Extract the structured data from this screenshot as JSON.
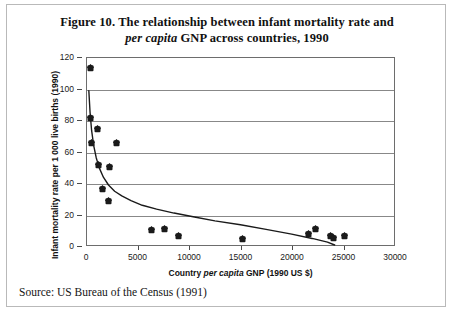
{
  "figure": {
    "title_line1": "Figure 10. The relationship between infant mortality rate and",
    "title_line2_italic": "per capita",
    "title_line2_rest": " GNP across countries, 1990",
    "source": "Source: US Bureau of the Census (1991)"
  },
  "chart_data": {
    "type": "scatter",
    "title": "Figure 10. The relationship between infant mortality rate and per capita GNP across countries, 1990",
    "xlabel_prefix": "Country ",
    "xlabel_italic": "per capita",
    "xlabel_suffix": " GNP (1990 US $)",
    "xlabel": "Country per capita GNP (1990 US $)",
    "ylabel": "Infant mortality rate per 1 000 live births (1990)",
    "xlim": [
      0,
      30000
    ],
    "ylim": [
      0,
      120
    ],
    "xticks": [
      0,
      5000,
      10000,
      15000,
      20000,
      25000,
      30000
    ],
    "yticks": [
      0,
      20,
      40,
      60,
      80,
      100,
      120
    ],
    "xtick_labels": [
      "0",
      "5000",
      "10000",
      "15000",
      "20000",
      "25000",
      "30000"
    ],
    "ytick_labels": [
      "0",
      "20",
      "40",
      "60",
      "80",
      "100",
      "120"
    ],
    "grid": "horizontal",
    "legend": "none",
    "marker": "diamond",
    "marker_color": "#1a1a1a",
    "curve_color": "#1a1a1a",
    "points": [
      {
        "x": 300,
        "y": 114.0
      },
      {
        "x": 350,
        "y": 82.5
      },
      {
        "x": 420,
        "y": 66.5
      },
      {
        "x": 1000,
        "y": 75.0
      },
      {
        "x": 1100,
        "y": 52.5
      },
      {
        "x": 1500,
        "y": 37.0
      },
      {
        "x": 2100,
        "y": 29.5
      },
      {
        "x": 2200,
        "y": 51.0
      },
      {
        "x": 2900,
        "y": 66.5
      },
      {
        "x": 6300,
        "y": 11.0
      },
      {
        "x": 7500,
        "y": 11.5
      },
      {
        "x": 8900,
        "y": 7.0
      },
      {
        "x": 15100,
        "y": 5.5
      },
      {
        "x": 21500,
        "y": 8.5
      },
      {
        "x": 22200,
        "y": 11.5
      },
      {
        "x": 23600,
        "y": 7.5
      },
      {
        "x": 23900,
        "y": 6.0
      },
      {
        "x": 25000,
        "y": 7.5
      }
    ],
    "fit_curve": [
      {
        "x": 180,
        "y": 99.0
      },
      {
        "x": 300,
        "y": 85.0
      },
      {
        "x": 450,
        "y": 73.5
      },
      {
        "x": 650,
        "y": 64.0
      },
      {
        "x": 900,
        "y": 56.0
      },
      {
        "x": 1200,
        "y": 49.5
      },
      {
        "x": 1600,
        "y": 43.5
      },
      {
        "x": 2100,
        "y": 38.5
      },
      {
        "x": 2700,
        "y": 34.5
      },
      {
        "x": 3400,
        "y": 31.5
      },
      {
        "x": 4300,
        "y": 28.5
      },
      {
        "x": 5400,
        "y": 25.5
      },
      {
        "x": 6800,
        "y": 23.0
      },
      {
        "x": 8500,
        "y": 20.5
      },
      {
        "x": 10500,
        "y": 18.0
      },
      {
        "x": 12500,
        "y": 15.5
      },
      {
        "x": 15000,
        "y": 13.0
      },
      {
        "x": 17500,
        "y": 10.0
      },
      {
        "x": 20000,
        "y": 7.0
      },
      {
        "x": 22000,
        "y": 4.2
      },
      {
        "x": 23500,
        "y": 1.8
      },
      {
        "x": 24200,
        "y": 0.0
      }
    ]
  }
}
